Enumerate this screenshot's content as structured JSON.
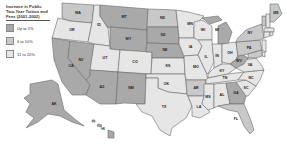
{
  "legend": {
    "title": "Increase in Public Two-Year Tuition and Fees (2001-2002)",
    "items": [
      {
        "label": "Up to 5%",
        "color": "#a9a9a9"
      },
      {
        "label": "6 to 10%",
        "color": "#c8c8c8"
      },
      {
        "label": "11 to 20%",
        "color": "#e6e6e6"
      }
    ]
  },
  "colors": {
    "dark": "#a9a9a9",
    "medium": "#c8c8c8",
    "light": "#e6e6e6",
    "border": "#6a6a6a"
  },
  "states": [
    {
      "abbr": "WA",
      "shade": "medium"
    },
    {
      "abbr": "OR",
      "shade": "light"
    },
    {
      "abbr": "CA",
      "shade": "dark"
    },
    {
      "abbr": "NV",
      "shade": "dark"
    },
    {
      "abbr": "ID",
      "shade": "light"
    },
    {
      "abbr": "MT",
      "shade": "dark"
    },
    {
      "abbr": "WY",
      "shade": "dark"
    },
    {
      "abbr": "UT",
      "shade": "light"
    },
    {
      "abbr": "AZ",
      "shade": "dark"
    },
    {
      "abbr": "CO",
      "shade": "light"
    },
    {
      "abbr": "NM",
      "shade": "dark"
    },
    {
      "abbr": "ND",
      "shade": "medium"
    },
    {
      "abbr": "SD",
      "shade": "dark"
    },
    {
      "abbr": "NE",
      "shade": "dark"
    },
    {
      "abbr": "KS",
      "shade": "light"
    },
    {
      "abbr": "OK",
      "shade": "light"
    },
    {
      "abbr": "TX",
      "shade": "light"
    },
    {
      "abbr": "MN",
      "shade": "light"
    },
    {
      "abbr": "IA",
      "shade": "light"
    },
    {
      "abbr": "MO",
      "shade": "light"
    },
    {
      "abbr": "AR",
      "shade": "medium"
    },
    {
      "abbr": "LA",
      "shade": "light"
    },
    {
      "abbr": "WI",
      "shade": "light"
    },
    {
      "abbr": "IL",
      "shade": "light"
    },
    {
      "abbr": "MI",
      "shade": "dark"
    },
    {
      "abbr": "IN",
      "shade": "light"
    },
    {
      "abbr": "OH",
      "shade": "light"
    },
    {
      "abbr": "KY",
      "shade": "light"
    },
    {
      "abbr": "TN",
      "shade": "light"
    },
    {
      "abbr": "MS",
      "shade": "light"
    },
    {
      "abbr": "AL",
      "shade": "light"
    },
    {
      "abbr": "GA",
      "shade": "dark"
    },
    {
      "abbr": "FL",
      "shade": "medium"
    },
    {
      "abbr": "SC",
      "shade": "light"
    },
    {
      "abbr": "NC",
      "shade": "light"
    },
    {
      "abbr": "VA",
      "shade": "light"
    },
    {
      "abbr": "WV",
      "shade": "dark"
    },
    {
      "abbr": "PA",
      "shade": "medium"
    },
    {
      "abbr": "NY",
      "shade": "medium"
    },
    {
      "abbr": "VT",
      "shade": "medium"
    },
    {
      "abbr": "NH",
      "shade": "light"
    },
    {
      "abbr": "ME",
      "shade": "medium"
    },
    {
      "abbr": "MA",
      "shade": "light"
    },
    {
      "abbr": "CT",
      "shade": "light"
    },
    {
      "abbr": "RI",
      "shade": "light"
    },
    {
      "abbr": "NJ",
      "shade": "light"
    },
    {
      "abbr": "DE",
      "shade": "light"
    },
    {
      "abbr": "MD",
      "shade": "medium"
    },
    {
      "abbr": "AK",
      "shade": "dark"
    },
    {
      "abbr": "HI",
      "shade": "dark"
    }
  ]
}
